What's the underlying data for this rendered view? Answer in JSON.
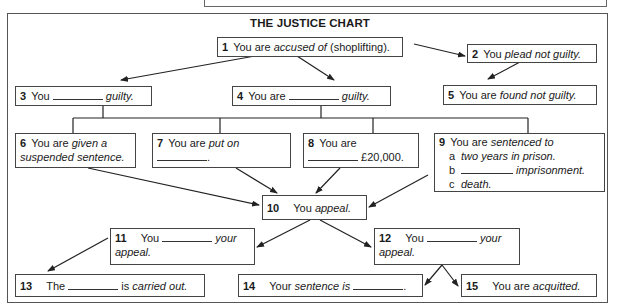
{
  "chart": {
    "title": "THE JUSTICE CHART",
    "boxes": {
      "b1": {
        "num": "1",
        "pre": "You are ",
        "em": "accused of",
        "post": " (shoplifting)."
      },
      "b2": {
        "num": "2",
        "pre": "You ",
        "em": "plead not guilty."
      },
      "b3": {
        "num": "3",
        "pre": "You ",
        "em": "guilty."
      },
      "b4": {
        "num": "4",
        "pre": "You are ",
        "em": "guilty."
      },
      "b5": {
        "num": "5",
        "pre": "You are ",
        "em": "found not guilty."
      },
      "b6": {
        "num": "6",
        "pre": "You are ",
        "em1": "given a",
        "em2": "suspended sentence."
      },
      "b7": {
        "num": "7",
        "pre": "You are ",
        "em": "put on",
        "post": "."
      },
      "b8": {
        "num": "8",
        "pre": "You are",
        "post": " £20,000."
      },
      "b9": {
        "num": "9",
        "pre": "You are ",
        "em": "sentenced to",
        "a_label": "a",
        "a_text": "two years in prison.",
        "b_label": "b",
        "b_text": " imprisonment.",
        "c_label": "c",
        "c_text": "death."
      },
      "b10": {
        "num": "10",
        "pre": "You ",
        "em": "appeal."
      },
      "b11": {
        "num": "11",
        "pre": "You ",
        "em": " your",
        "em2": "appeal."
      },
      "b12": {
        "num": "12",
        "pre": "You ",
        "em": " your",
        "em2": "appeal."
      },
      "b13": {
        "num": "13",
        "pre": "The ",
        "post": " is ",
        "em": "carried out."
      },
      "b14": {
        "num": "14",
        "pre": "Your ",
        "em": "sentence is ",
        "post": "."
      },
      "b15": {
        "num": "15",
        "pre": "You are ",
        "em": "acquitted."
      }
    }
  }
}
